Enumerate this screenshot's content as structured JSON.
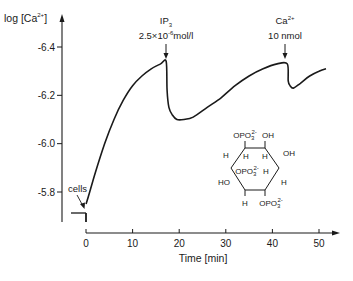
{
  "chart_data": {
    "type": "line",
    "title": "",
    "xlabel": "Time [min]",
    "ylabel": "log [Ca2+]",
    "ylabel_parts": {
      "prefix": "log [Ca",
      "sup": "2+",
      "suffix": "]"
    },
    "xlim": [
      0,
      52
    ],
    "ylim": [
      -5.73,
      -6.45
    ],
    "y_inverted": true,
    "x_ticks": [
      0,
      10,
      20,
      30,
      40,
      50
    ],
    "x_tick_labels": [
      "0",
      "10",
      "20",
      "30",
      "40",
      "50"
    ],
    "y_ticks": [
      -6.4,
      -6.2,
      -6.0,
      -5.8
    ],
    "y_tick_labels": [
      "-6.4",
      "-6.2",
      "-6.0",
      "-5.8"
    ],
    "grid": false,
    "legend": null,
    "series": [
      {
        "name": "log [Ca2+]",
        "x": [
          0,
          0.5,
          2,
          4,
          6,
          8,
          10,
          12,
          14,
          16,
          17.2,
          17.4,
          17.8,
          18.5,
          19.5,
          21,
          23,
          26,
          29,
          32,
          35,
          38,
          41,
          43.2,
          43.4,
          43.8,
          44.5,
          46,
          48,
          50,
          51.5
        ],
        "values": [
          -5.75,
          -5.78,
          -5.88,
          -6.0,
          -6.1,
          -6.18,
          -6.24,
          -6.28,
          -6.31,
          -6.33,
          -6.34,
          -6.22,
          -6.15,
          -6.12,
          -6.1,
          -6.1,
          -6.11,
          -6.15,
          -6.19,
          -6.24,
          -6.28,
          -6.31,
          -6.33,
          -6.33,
          -6.26,
          -6.24,
          -6.23,
          -6.25,
          -6.28,
          -6.3,
          -6.31
        ]
      }
    ],
    "annotations": [
      {
        "label": "cells",
        "x": 0,
        "y": -5.77,
        "type": "arrow"
      },
      {
        "label": "IP3",
        "label_sub": "3",
        "label_main": "IP",
        "dose": "2.5×10⁻⁶mol/l",
        "dose_base": "2.5×10",
        "dose_exp": "-6",
        "dose_unit": "mol/l",
        "x": 17.2,
        "type": "arrow-down"
      },
      {
        "label": "Ca2+",
        "label_main": "Ca",
        "label_sup": "2+",
        "dose": "10 nmol",
        "x": 43.2,
        "type": "arrow-down"
      }
    ],
    "baseline_label": "cells",
    "inset_structure": {
      "name": "inositol trisphosphate",
      "groups": {
        "top_left": "OPO3 2-",
        "top_right": "OH",
        "right": "OH",
        "left": "HO",
        "middle_left": "OPO3 2-",
        "bottom_right": "OPO3 2-",
        "hydrogens": [
          "H",
          "H",
          "H",
          "H",
          "H",
          "H"
        ]
      },
      "labels": {
        "opo3": "OPO",
        "opo3_sub": "3",
        "opo3_sup": "2-",
        "oh": "OH",
        "ho": "HO",
        "h": "H"
      }
    }
  }
}
